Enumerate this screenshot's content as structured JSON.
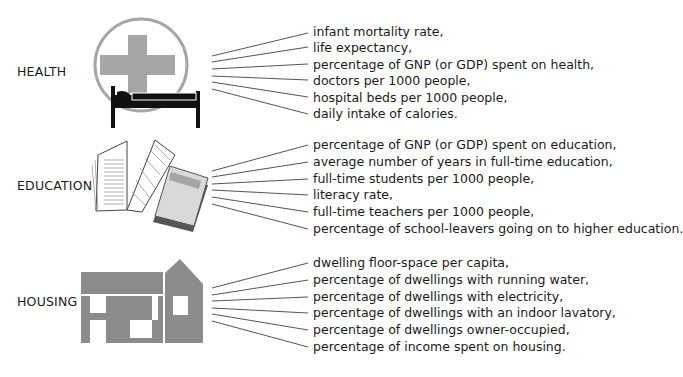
{
  "categories": [
    {
      "id": "health",
      "label": "HEALTH",
      "icon": "hospital-bed-cross-icon",
      "items": [
        "infant mortality rate,",
        "life expectancy,",
        "percentage of GNP (or GDP) spent on health,",
        "doctors per 1000 people,",
        "hospital beds per 1000 people,",
        "daily intake of calories."
      ]
    },
    {
      "id": "education",
      "label": "EDUCATION",
      "icon": "books-icon",
      "items": [
        "percentage of GNP (or GDP) spent on education,",
        "average number of years in full-time education,",
        "full-time students per 1000 people,",
        "literacy rate,",
        "full-time teachers per 1000 people,",
        "percentage of school-leavers going on to higher education."
      ]
    },
    {
      "id": "housing",
      "label": "HOUSING",
      "icon": "house-icon",
      "items": [
        "dwelling floor-space per capita,",
        "percentage of dwellings with running water,",
        "percentage of dwellings with electricity,",
        "percentage of dwellings with an indoor lavatory,",
        "percentage of dwellings owner-occupied,",
        "percentage of income spent on housing."
      ]
    }
  ],
  "colors": {
    "icon_gray": "#8c8c8c",
    "cross_gray": "#a6a6a6",
    "line": "#555555",
    "text": "#1a1a1a"
  }
}
